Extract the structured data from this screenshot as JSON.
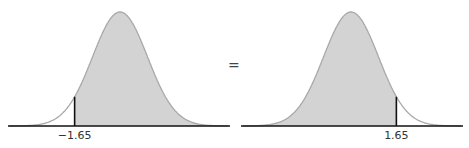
{
  "chart_data": [
    {
      "type": "area",
      "title": "",
      "description": "Standard normal curve shaded to the right of z = -1.65",
      "distribution": "standard normal",
      "shaded_region": "right of cutoff",
      "cutoff": -1.65,
      "tick_labels": [
        "−1.65"
      ],
      "xlim": [
        -3.5,
        3.5
      ],
      "grid": false
    },
    {
      "type": "area",
      "title": "",
      "description": "Standard normal curve shaded to the left of z = 1.65",
      "distribution": "standard normal",
      "shaded_region": "left of cutoff",
      "cutoff": 1.65,
      "tick_labels": [
        "1.65"
      ],
      "xlim": [
        -3.5,
        3.5
      ],
      "grid": false
    }
  ],
  "labels": {
    "left_cutoff": "−1.65",
    "right_cutoff": "1.65",
    "equals": "="
  },
  "colors": {
    "shade": "#d3d3d3",
    "curve": "#a8a8a8",
    "axis": "#111111"
  }
}
